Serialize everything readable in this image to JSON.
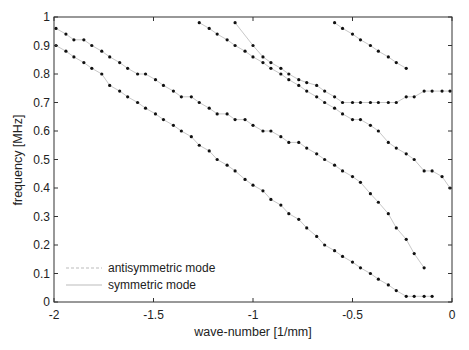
{
  "chart_data": {
    "type": "scatter",
    "title": "",
    "xlabel": "wave-number [1/mm]",
    "ylabel": "frequency [MHz]",
    "xlim": [
      -2,
      0
    ],
    "ylim": [
      0,
      1
    ],
    "xticks": [
      "-2",
      "-1.5",
      "-1",
      "-0.5",
      "0"
    ],
    "yticks": [
      "0",
      "0.1",
      "0.2",
      "0.3",
      "0.4",
      "0.5",
      "0.6",
      "0.7",
      "0.8",
      "0.9",
      "1"
    ],
    "grid": false,
    "legend_position": "lower left",
    "legend": [
      {
        "label": "antisymmetric mode",
        "style": "dashed"
      },
      {
        "label": "symmetric mode",
        "style": "solid"
      }
    ],
    "series": [
      {
        "name": "measured mode 1",
        "marker": "dot",
        "x": [
          -1.99,
          -1.94,
          -1.9,
          -1.85,
          -1.81,
          -1.76,
          -1.72,
          -1.67,
          -1.63,
          -1.58,
          -1.54,
          -1.49,
          -1.45,
          -1.4,
          -1.36,
          -1.31,
          -1.27,
          -1.22,
          -1.18,
          -1.13,
          -1.09,
          -1.04,
          -1.0,
          -0.95,
          -0.91,
          -0.86,
          -0.82,
          -0.77,
          -0.73,
          -0.68,
          -0.64,
          -0.59,
          -0.55,
          -0.5,
          -0.46,
          -0.41,
          -0.37,
          -0.32,
          -0.28,
          -0.23,
          -0.19,
          -0.14,
          -0.1
        ],
        "y": [
          0.9,
          0.88,
          0.86,
          0.84,
          0.82,
          0.8,
          0.76,
          0.74,
          0.72,
          0.7,
          0.68,
          0.66,
          0.64,
          0.62,
          0.6,
          0.58,
          0.55,
          0.53,
          0.5,
          0.48,
          0.46,
          0.43,
          0.41,
          0.39,
          0.36,
          0.34,
          0.31,
          0.29,
          0.26,
          0.23,
          0.2,
          0.18,
          0.16,
          0.14,
          0.12,
          0.1,
          0.08,
          0.06,
          0.04,
          0.02,
          0.02,
          0.02,
          0.02
        ]
      },
      {
        "name": "measured mode 2",
        "marker": "dot",
        "x": [
          -1.99,
          -1.94,
          -1.9,
          -1.85,
          -1.81,
          -1.76,
          -1.72,
          -1.67,
          -1.63,
          -1.58,
          -1.54,
          -1.49,
          -1.45,
          -1.4,
          -1.36,
          -1.31,
          -1.27,
          -1.22,
          -1.18,
          -1.13,
          -1.09,
          -1.04,
          -1.0,
          -0.95,
          -0.91,
          -0.86,
          -0.82,
          -0.77,
          -0.73,
          -0.68,
          -0.64,
          -0.59,
          -0.55,
          -0.5,
          -0.46,
          -0.41,
          -0.37,
          -0.32,
          -0.28,
          -0.23,
          -0.19,
          -0.14
        ],
        "y": [
          0.96,
          0.94,
          0.92,
          0.92,
          0.9,
          0.88,
          0.86,
          0.84,
          0.82,
          0.8,
          0.8,
          0.78,
          0.76,
          0.74,
          0.72,
          0.72,
          0.7,
          0.68,
          0.66,
          0.66,
          0.64,
          0.64,
          0.62,
          0.6,
          0.6,
          0.58,
          0.56,
          0.56,
          0.54,
          0.52,
          0.5,
          0.48,
          0.46,
          0.44,
          0.42,
          0.38,
          0.35,
          0.31,
          0.26,
          0.22,
          0.17,
          0.12
        ]
      },
      {
        "name": "measured mode 3",
        "marker": "dot",
        "x": [
          -1.27,
          -1.22,
          -1.18,
          -1.13,
          -1.09,
          -1.04,
          -1.0,
          -0.95,
          -0.91,
          -0.86,
          -0.82,
          -0.77,
          -0.73,
          -0.68,
          -0.64,
          -0.59,
          -0.55,
          -0.5,
          -0.46,
          -0.41,
          -0.37,
          -0.32,
          -0.28,
          -0.23,
          -0.19,
          -0.14,
          -0.1,
          -0.05,
          -0.01
        ],
        "y": [
          0.98,
          0.96,
          0.94,
          0.92,
          0.9,
          0.88,
          0.86,
          0.84,
          0.82,
          0.8,
          0.78,
          0.76,
          0.74,
          0.72,
          0.7,
          0.68,
          0.66,
          0.64,
          0.64,
          0.62,
          0.6,
          0.56,
          0.54,
          0.52,
          0.5,
          0.46,
          0.46,
          0.44,
          0.4
        ]
      },
      {
        "name": "measured mode 4",
        "marker": "dot",
        "x": [
          -1.09,
          -1.0,
          -0.95,
          -0.91,
          -0.86,
          -0.82,
          -0.77,
          -0.73,
          -0.68,
          -0.64,
          -0.59,
          -0.55,
          -0.5,
          -0.46,
          -0.41,
          -0.37,
          -0.32,
          -0.28,
          -0.23,
          -0.19,
          -0.14,
          -0.1,
          -0.05,
          -0.01
        ],
        "y": [
          0.98,
          0.9,
          0.86,
          0.84,
          0.82,
          0.8,
          0.78,
          0.77,
          0.76,
          0.74,
          0.72,
          0.7,
          0.7,
          0.7,
          0.7,
          0.7,
          0.7,
          0.7,
          0.72,
          0.72,
          0.74,
          0.74,
          0.74,
          0.74
        ]
      },
      {
        "name": "measured mode 5",
        "marker": "dot",
        "x": [
          -0.59,
          -0.55,
          -0.5,
          -0.46,
          -0.41,
          -0.37,
          -0.32,
          -0.28,
          -0.23
        ],
        "y": [
          0.98,
          0.96,
          0.94,
          0.92,
          0.9,
          0.88,
          0.86,
          0.84,
          0.82
        ]
      }
    ]
  }
}
